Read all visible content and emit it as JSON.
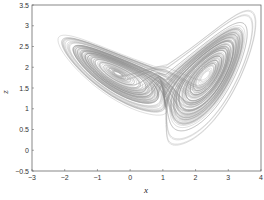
{
  "chart_data": {
    "type": "line",
    "title": "",
    "xlabel": "x",
    "ylabel": "z",
    "xlim": [
      -3,
      4
    ],
    "ylim": [
      -0.5,
      3.5
    ],
    "xticks": [
      "-3",
      "-2",
      "-1",
      "0",
      "1",
      "2",
      "3",
      "4"
    ],
    "yticks": [
      "-0.5",
      "0",
      "0.5",
      "1",
      "1.5",
      "2",
      "2.5",
      "3",
      "3.5"
    ],
    "grid": false,
    "legend": null,
    "series": [
      {
        "name": "trajectory",
        "color": "#888888",
        "left_lobe": {
          "x_range": [
            -2.3,
            1.5
          ],
          "z_range": [
            0.8,
            2.55
          ]
        },
        "right_lobe": {
          "x_range": [
            0.0,
            3.85
          ],
          "z_range": [
            0.1,
            3.15
          ]
        }
      }
    ]
  }
}
